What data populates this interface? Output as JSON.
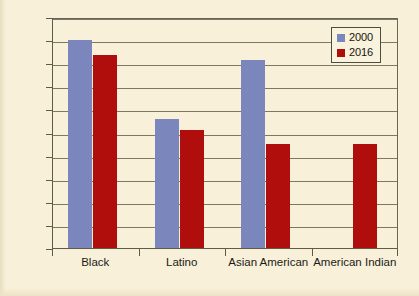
{
  "chart_data": {
    "type": "bar",
    "title": "",
    "subtitle": "",
    "xlabel": "",
    "ylabel": "",
    "categories": [
      "Black",
      "Latino",
      "Asian American",
      "American Indian"
    ],
    "series": [
      {
        "name": "2000",
        "color": "#7b87bc",
        "values": [
          0.9,
          0.56,
          0.815,
          null
        ]
      },
      {
        "name": "2016",
        "color": "#b00d0d",
        "values": [
          0.835,
          0.51,
          0.45,
          0.45
        ]
      }
    ],
    "ylim": [
      0,
      1
    ],
    "ytick_step": 0.1,
    "ytick_labels": [
      "0",
      "0.1",
      "0.2",
      "0.3",
      "0.4",
      "0.5",
      "0.6",
      "0.7",
      "0.8",
      "0.9",
      "1"
    ],
    "ytick_values": [
      0,
      0.1,
      0.2,
      0.3,
      0.4,
      0.5,
      0.6,
      0.7,
      0.8,
      0.9,
      1
    ],
    "grid": true,
    "grid_axis": "y",
    "legend_position": "top-right",
    "legend_entries": [
      "2000",
      "2016"
    ],
    "annotations": []
  },
  "colors": {
    "background": "#f8f0d8",
    "axis": "#5d5a4e",
    "gridline": "#7d7866",
    "series_2000": "#7b87bc",
    "series_2016": "#b00d0d",
    "text": "#1b1b19"
  }
}
